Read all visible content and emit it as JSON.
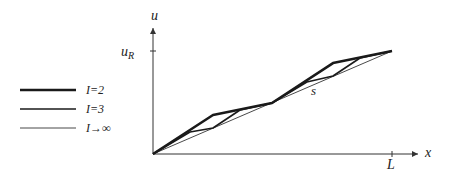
{
  "diagram": {
    "axes": {
      "y_label": "u",
      "y_tick_label_main": "u",
      "y_tick_label_sub": "R",
      "x_label": "x",
      "x_tick_label": "L"
    },
    "annotation": "s",
    "legend": [
      {
        "label": "I=2",
        "weight": "thick"
      },
      {
        "label": "I=3",
        "weight": "medium"
      },
      {
        "label": "I→∞",
        "weight": "thin"
      }
    ],
    "colors": {
      "line": "#1a1a1a",
      "axis": "#333333"
    },
    "curves": {
      "note": "Coordinates in normalized data units: x in [0,1] of L, u in [0,1] of u_R",
      "I_inf": [
        [
          0,
          0
        ],
        [
          1,
          1
        ]
      ],
      "I_2": [
        [
          0,
          0
        ],
        [
          0.251,
          0.379
        ],
        [
          0.498,
          0.495
        ],
        [
          0.753,
          0.883
        ],
        [
          1,
          1
        ]
      ],
      "I_3": [
        [
          0,
          0
        ],
        [
          0.155,
          0.214
        ],
        [
          0.251,
          0.252
        ],
        [
          0.364,
          0.427
        ],
        [
          0.498,
          0.495
        ],
        [
          0.644,
          0.699
        ],
        [
          0.753,
          0.757
        ],
        [
          0.866,
          0.932
        ],
        [
          1,
          1
        ]
      ]
    }
  }
}
